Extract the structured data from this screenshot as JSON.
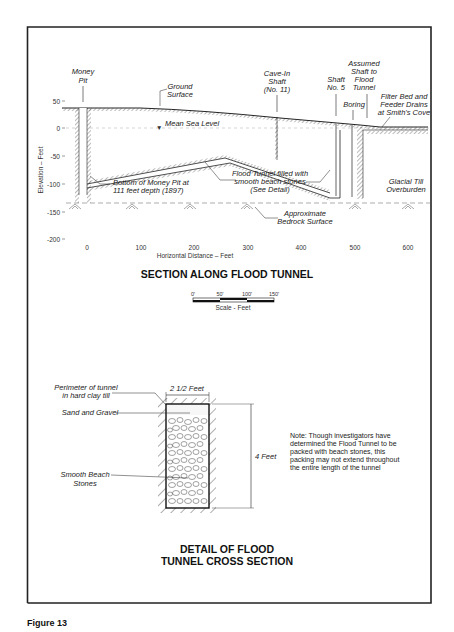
{
  "section": {
    "title": "SECTION ALONG FLOOD TUNNEL",
    "y_axis_label": "Elevation  –  Feet",
    "x_axis_label": "Horizontal Distance  –  Feet",
    "y_ticks": [
      "50",
      "0",
      "-50",
      "-100",
      "-150",
      "-200"
    ],
    "x_ticks": [
      "0",
      "100",
      "200",
      "300",
      "400",
      "500",
      "600"
    ],
    "labels": {
      "money_pit": [
        "Money",
        "Pit"
      ],
      "ground_surface": [
        "Ground",
        "Surface"
      ],
      "mean_sea_level": "Mean Sea Level",
      "cave_in_shaft": [
        "Cave-In",
        "Shaft",
        "(No. 11)"
      ],
      "shaft_no5": [
        "Shaft",
        "No. 5"
      ],
      "assumed_shaft": [
        "Assumed",
        "Shaft to",
        "Flood",
        "Tunnel"
      ],
      "boring": "Boring",
      "filter_bed": [
        "Filter Bed and",
        "Feeder Drains",
        "at Smith's Cove"
      ],
      "bottom_money_pit": [
        "Bottom of Money Pit at",
        "111 feet depth (1897)"
      ],
      "flood_tunnel": [
        "Flood Tunnel filled with",
        "smooth beach stones",
        "(See Detail)"
      ],
      "glacial_till": [
        "Glacial Till",
        "Overburden"
      ],
      "bedrock": [
        "Approximate",
        "Bedrock Surface"
      ]
    }
  },
  "scale": {
    "ticks": [
      "0'",
      "50'",
      "100'",
      "150'"
    ],
    "label": "Scale - Feet"
  },
  "detail": {
    "title_line1": "DETAIL OF FLOOD",
    "title_line2": "TUNNEL CROSS SECTION",
    "width_label": "2 1/2 Feet",
    "height_label": "4 Feet",
    "labels": {
      "perimeter": [
        "Perimeter of tunnel",
        "in hard clay till"
      ],
      "sand_gravel": "Sand and Gravel",
      "beach_stones": [
        "Smooth Beach",
        "Stones"
      ]
    },
    "note": [
      "Note: Though investigators have",
      "determined the Flood Tunnel to be",
      "packed with beach stones, this",
      "packing may not extend throughout",
      "the entire length of the tunnel"
    ]
  },
  "caption": "Figure 13"
}
